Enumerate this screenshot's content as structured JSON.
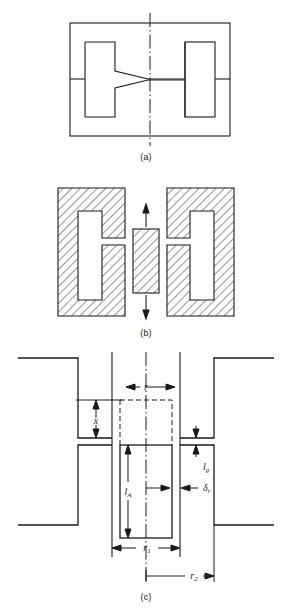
{
  "figure": {
    "stroke_color": "#1a1a1a",
    "hatch_color": "#2b2b2b",
    "background": "#ffffff"
  },
  "captions": {
    "a": "(a)",
    "b": "(b)",
    "c": "(c)"
  },
  "panel_a": {
    "name": "plan-view",
    "description": "Outer rectangular frame with two inner rectangular coil windows and a tapered central web on the axis of symmetry",
    "centerline": "dash-dot vertical axis of symmetry"
  },
  "panel_b": {
    "name": "hatched-cross-section",
    "description": "Two hatched C-shaped core halves with a hatched central plunger between them",
    "motion_arrows": [
      "up",
      "down"
    ],
    "hatch_angle_deg": 45
  },
  "panel_c": {
    "name": "dimensioned-cross-section",
    "dimensions": [
      {
        "symbol": "r",
        "label": "r",
        "sub": "",
        "kind": "horizontal",
        "meaning": "plunger radius"
      },
      {
        "symbol": "x",
        "label": "x",
        "sub": "",
        "kind": "vertical",
        "meaning": "plunger travel / air-gap displacement"
      },
      {
        "symbol": "lg",
        "label": "l",
        "sub": "g",
        "kind": "vertical",
        "meaning": "gap length"
      },
      {
        "symbol": "lA",
        "label": "l",
        "sub": "A",
        "kind": "vertical",
        "meaning": "axial length of plunger"
      },
      {
        "symbol": "deltar",
        "label": "δ",
        "sub": "r",
        "kind": "horizontal",
        "meaning": "radial clearance"
      },
      {
        "symbol": "r1",
        "label": "r",
        "sub": "1",
        "kind": "horizontal",
        "meaning": "inner radius"
      },
      {
        "symbol": "r2",
        "label": "r",
        "sub": "2",
        "kind": "horizontal",
        "meaning": "outer radius"
      }
    ],
    "centerline": "dash-dot vertical axis of symmetry",
    "dashed_outline": "dashed rectangle showing displaced plunger position"
  }
}
